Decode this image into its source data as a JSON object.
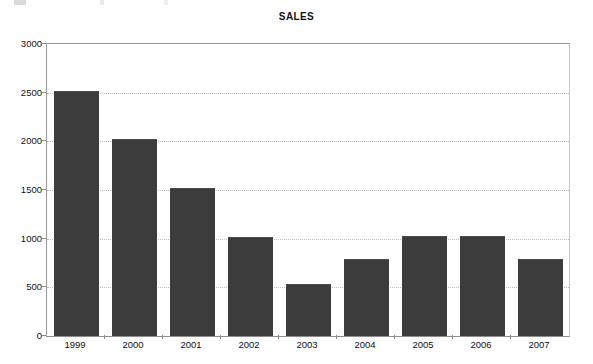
{
  "figure": {
    "title": "SALES",
    "background_color": "#ffffff",
    "bar_color": "#3c3c3c",
    "gridline_color": "#bdbdbd",
    "axis_color": "#8d8d8d",
    "scan_remnant_name": "cropped-text-remnant"
  },
  "chart_data": {
    "type": "bar",
    "title": "SALES",
    "xlabel": "",
    "ylabel": "",
    "categories": [
      "1999",
      "2000",
      "2001",
      "2002",
      "2003",
      "2004",
      "2005",
      "2006",
      "2007"
    ],
    "values": [
      2510,
      2010,
      1510,
      1010,
      520,
      780,
      1020,
      1020,
      780
    ],
    "series": [
      {
        "name": "SALES",
        "values": [
          2510,
          2010,
          1510,
          1010,
          520,
          780,
          1020,
          1020,
          780
        ]
      }
    ],
    "ylim": [
      0,
      3000
    ],
    "yticks": [
      0,
      500,
      1000,
      1500,
      2000,
      2500,
      3000
    ],
    "ytick_labels": [
      "0",
      "500",
      "1000",
      "1500",
      "2000",
      "2500",
      "3000"
    ],
    "grid": true,
    "grid_axis": "y",
    "grid_style": "dotted",
    "legend": false,
    "legend_position": "none"
  }
}
